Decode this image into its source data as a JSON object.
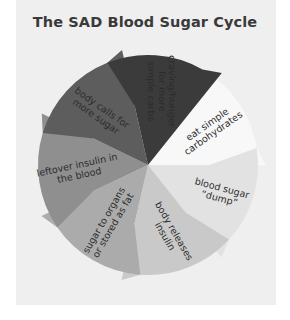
{
  "title": "The SAD Blood Sugar Cycle",
  "segments": [
    {
      "id": "craving",
      "lines": [
        "craving/hunger",
        "for more",
        "simple carbs"
      ],
      "color": "#3b3b3b"
    },
    {
      "id": "eat",
      "lines": [
        "eat simple",
        "carbohydrates"
      ],
      "color": "#f8f8f8"
    },
    {
      "id": "dump",
      "lines": [
        "blood sugar",
        "“dump”"
      ],
      "color": "#e2e2e2"
    },
    {
      "id": "insulin",
      "lines": [
        "body releases",
        "insulin"
      ],
      "color": "#c9c9c9"
    },
    {
      "id": "organs",
      "lines": [
        "sugar to organs",
        "or stored as fat"
      ],
      "color": "#ababab"
    },
    {
      "id": "leftover",
      "lines": [
        "leftover insulin in",
        "the blood"
      ],
      "color": "#8f8f8f"
    },
    {
      "id": "calls",
      "lines": [
        "body calls for",
        "more sugar"
      ],
      "color": "#5d5d5d"
    }
  ]
}
